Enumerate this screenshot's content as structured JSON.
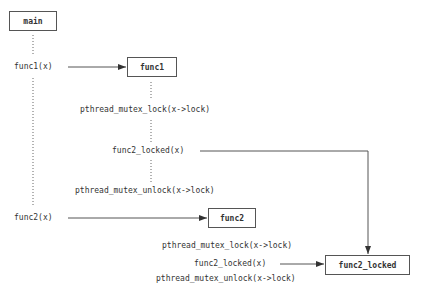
{
  "boxes": {
    "main": "main",
    "func1": "func1",
    "func2": "func2",
    "func2_locked": "func2_locked"
  },
  "labels": {
    "call_func1": "func1(x)",
    "call_func2": "func2(x)",
    "f1_lock": "pthread_mutex_lock(x->lock)",
    "f1_call_locked": "func2_locked(x)",
    "f1_unlock": "pthread_mutex_unlock(x->lock)",
    "f2_lock": "pthread_mutex_lock(x->lock)",
    "f2_call_locked": "func2_locked(x)",
    "f2_unlock": "pthread_mutex_unlock(x->lock)"
  },
  "colors": {
    "line": "#555555",
    "text": "#333333"
  }
}
